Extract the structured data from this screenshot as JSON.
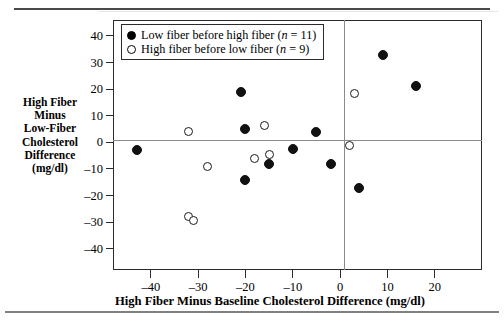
{
  "figure": {
    "top_rule": "rule",
    "bottom_rule": "rule"
  },
  "legend": {
    "entries": [
      {
        "marker": "filled-circle",
        "label": "Low fiber before high fiber (n = 11)",
        "text_before": "Low fiber before high fiber (",
        "n_symbol": "n",
        "text_mid": " = ",
        "n_value": "11",
        "text_after": ")"
      },
      {
        "marker": "open-circle",
        "label": "High fiber before low fiber (n = 9)",
        "text_before": "High fiber before low fiber (",
        "n_symbol": "n",
        "text_mid": " = ",
        "n_value": "9",
        "text_after": ")"
      }
    ]
  },
  "axes": {
    "ylabel_lines": [
      "High Fiber",
      "Minus",
      "Low-Fiber",
      "Cholesterol",
      "Difference",
      "(mg/dl)"
    ],
    "xlabel": "High Fiber Minus Baseline Cholesterol Difference (mg/dl)",
    "yticks": [
      "40",
      "30",
      "20",
      "10",
      "0",
      "–10",
      "–20",
      "–30",
      "–40"
    ],
    "xticks": [
      "–40",
      "–30",
      "–20",
      "–10",
      "0",
      "10",
      "20"
    ]
  },
  "chart_data": {
    "type": "scatter",
    "title": "",
    "xlabel": "High Fiber Minus Baseline Cholesterol Difference (mg/dl)",
    "ylabel": "High Fiber Minus Low-Fiber Cholesterol Difference (mg/dl)",
    "xlim": [
      -48,
      30
    ],
    "ylim": [
      -48,
      46
    ],
    "xticks": [
      -40,
      -30,
      -20,
      -10,
      0,
      10,
      20
    ],
    "yticks": [
      40,
      30,
      20,
      10,
      0,
      -10,
      -20,
      -30,
      -40
    ],
    "grid": false,
    "reference_lines": {
      "horizontal": 0,
      "vertical": 0
    },
    "legend_position": "top-left-inside",
    "series": [
      {
        "name": "Low fiber before high fiber (n = 11)",
        "marker": "filled-circle",
        "color": "#111111",
        "n": 11,
        "points": [
          {
            "x": -43,
            "y": -3
          },
          {
            "x": -21,
            "y": 19
          },
          {
            "x": -20,
            "y": 5
          },
          {
            "x": -20,
            "y": -14
          },
          {
            "x": -15,
            "y": -8
          },
          {
            "x": -10,
            "y": -2.5
          },
          {
            "x": -5,
            "y": 4
          },
          {
            "x": -2,
            "y": -8
          },
          {
            "x": 4,
            "y": -17
          },
          {
            "x": 9,
            "y": 33
          },
          {
            "x": 16,
            "y": 21
          }
        ]
      },
      {
        "name": "High fiber before low fiber (n = 9)",
        "marker": "open-circle",
        "color": "#ffffff",
        "n": 9,
        "points": [
          {
            "x": -32,
            "y": 4
          },
          {
            "x": -32,
            "y": -28
          },
          {
            "x": -31,
            "y": -29.5
          },
          {
            "x": -28,
            "y": -9
          },
          {
            "x": -18,
            "y": -6
          },
          {
            "x": -16,
            "y": 6.5
          },
          {
            "x": -15,
            "y": -4.5
          },
          {
            "x": 2,
            "y": -1
          },
          {
            "x": 3,
            "y": 18.5
          }
        ]
      }
    ]
  }
}
